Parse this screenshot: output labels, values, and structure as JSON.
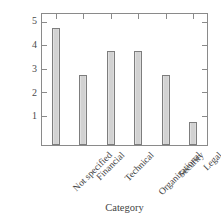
{
  "chart_data": {
    "type": "bar",
    "title": "",
    "subtitle": "",
    "xlabel": "Category",
    "ylabel": "Number of studies",
    "categories": [
      "Not specified",
      "Financial",
      "Technical",
      "Organizational",
      "Security",
      "Legal"
    ],
    "values": [
      5,
      3,
      4,
      4,
      3,
      1
    ],
    "series": [
      {
        "name": "Number of studies",
        "values": [
          5,
          3,
          4,
          4,
          3,
          1
        ]
      }
    ],
    "ylim": [
      0,
      5.6
    ],
    "yticks": [
      1,
      2,
      3,
      4,
      5
    ],
    "ytick_labels": [
      "1",
      "2",
      "3",
      "4",
      "5"
    ],
    "xtick_label_rotation": -45,
    "grid": false,
    "legend": false,
    "legend_position": "none",
    "bar_fill_color": "#d2d2d2",
    "bar_edge_color": "#7d7d7d",
    "axis_color": "#8a8a8a",
    "background_color": "#ffffff",
    "annotations": []
  },
  "axis": {
    "y_tick_1": "1",
    "y_tick_2": "2",
    "y_tick_3": "3",
    "y_tick_4": "4",
    "y_tick_5": "5"
  },
  "xcats": {
    "c0": "Not specified",
    "c1": "Financial",
    "c2": "Technical",
    "c3": "Organizational",
    "c4": "Security",
    "c5": "Legal"
  }
}
